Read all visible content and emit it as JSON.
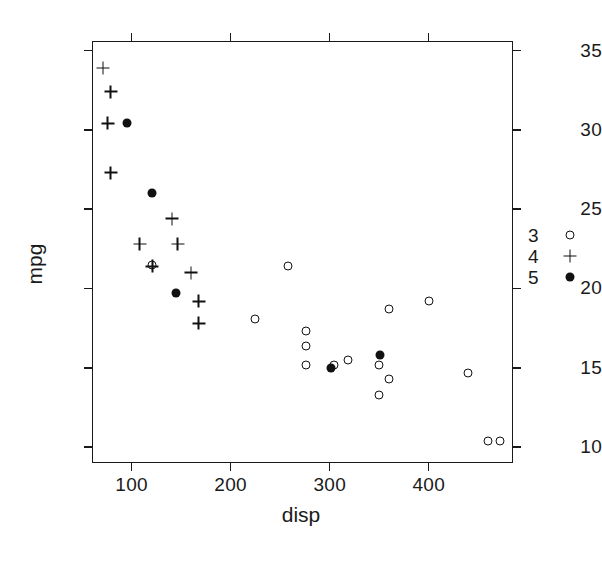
{
  "chart_data": {
    "type": "scatter",
    "title": "",
    "xlabel": "disp",
    "ylabel": "mpg",
    "xlim": [
      60,
      485
    ],
    "ylim": [
      9,
      35.6
    ],
    "xticks": [
      100,
      200,
      300,
      400
    ],
    "yticks": [
      35,
      30,
      25,
      20,
      15,
      10
    ],
    "grid": false,
    "legend": {
      "position": "right-outside",
      "title": "",
      "entries": [
        {
          "label": "3",
          "marker": "open-circle"
        },
        {
          "label": "4",
          "marker": "plus"
        },
        {
          "label": "5",
          "marker": "filled-circle"
        }
      ]
    },
    "series": [
      {
        "name": "3",
        "marker": "open-circle",
        "points": [
          {
            "x": 258,
            "y": 21.4
          },
          {
            "x": 225,
            "y": 18.1
          },
          {
            "x": 360,
            "y": 18.7
          },
          {
            "x": 400,
            "y": 19.2
          },
          {
            "x": 275.8,
            "y": 17.3
          },
          {
            "x": 275.8,
            "y": 16.4
          },
          {
            "x": 275.8,
            "y": 15.2
          },
          {
            "x": 318,
            "y": 15.5
          },
          {
            "x": 304,
            "y": 15.2
          },
          {
            "x": 350,
            "y": 15.2
          },
          {
            "x": 360,
            "y": 14.3
          },
          {
            "x": 350,
            "y": 13.3
          },
          {
            "x": 440,
            "y": 14.7
          },
          {
            "x": 460,
            "y": 10.4
          },
          {
            "x": 472,
            "y": 10.4
          },
          {
            "x": 120.1,
            "y": 21.5
          }
        ]
      },
      {
        "name": "4",
        "marker": "plus",
        "points": [
          {
            "x": 71.1,
            "y": 33.9
          },
          {
            "x": 78.7,
            "y": 32.4
          },
          {
            "x": 75.7,
            "y": 30.4
          },
          {
            "x": 79.0,
            "y": 27.3
          },
          {
            "x": 108.0,
            "y": 22.8
          },
          {
            "x": 140.8,
            "y": 24.4
          },
          {
            "x": 146.7,
            "y": 22.8
          },
          {
            "x": 121.0,
            "y": 21.4
          },
          {
            "x": 160.0,
            "y": 21.0
          },
          {
            "x": 167.6,
            "y": 19.2
          },
          {
            "x": 167.6,
            "y": 17.8
          }
        ]
      },
      {
        "name": "5",
        "marker": "filled-circle",
        "points": [
          {
            "x": 95.1,
            "y": 30.4
          },
          {
            "x": 120.3,
            "y": 26.0
          },
          {
            "x": 145.0,
            "y": 19.7
          },
          {
            "x": 301.0,
            "y": 15.0
          },
          {
            "x": 351.0,
            "y": 15.8
          }
        ]
      }
    ]
  },
  "axes": {
    "x_title": "disp",
    "y_title": "mpg",
    "x_tick_labels": [
      "100",
      "200",
      "300",
      "400"
    ],
    "y_tick_labels": [
      "35",
      "30",
      "25",
      "20",
      "15",
      "10"
    ]
  },
  "colors": {
    "marker": "#111111",
    "axis": "#1a1a1a",
    "background": "#ffffff"
  }
}
